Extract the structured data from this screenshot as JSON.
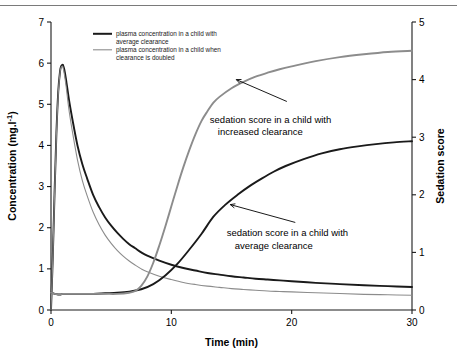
{
  "figure": {
    "top_rule": "horizontal-divider"
  },
  "chart_data": {
    "type": "line",
    "title": "",
    "xlabel": "Time (min)",
    "ylabel": "Concentration (mg.l-1)",
    "ylabel_display": "Concentration (mg.l",
    "ylabel_sup": "-1",
    "ylabel_tail": ")",
    "y2label": "Sedation score",
    "xlim": [
      0,
      30
    ],
    "ylim": [
      0,
      7
    ],
    "y2lim": [
      0,
      5
    ],
    "xticks": [
      0,
      10,
      20,
      30
    ],
    "yticks": [
      0,
      1,
      2,
      3,
      4,
      5,
      6,
      7
    ],
    "y2ticks": [
      0,
      1,
      2,
      3,
      4,
      5
    ],
    "grid": false,
    "legend_position": "top-left-inside",
    "colors": {
      "black": "#1a1a1a",
      "gray": "#8c8c8c"
    },
    "legend": [
      {
        "label": "plasma concentration in a child with average clearance",
        "line1": "plasma concentration in a child with",
        "line2": "average clearance",
        "color": "#1a1a1a",
        "width": 2.0
      },
      {
        "label": "plasma concentration in a child when clearance is doubled",
        "line1": "plasma concentration in a child when",
        "line2": "clearance is doubled",
        "color": "#8c8c8c",
        "width": 1.1
      }
    ],
    "annotations": [
      {
        "line1": "sedation score in a child with",
        "line2": "increased clearance",
        "text_x": 13.2,
        "text_y_axis2": 3.25,
        "arrow_from_x": 19.6,
        "arrow_from_y2": 3.62,
        "arrow_to_x": 15.4,
        "arrow_to_y2": 4.0
      },
      {
        "line1": "sedation score in a child with",
        "line2": "average clearance",
        "text_x": 14.6,
        "text_y_axis2": 1.28,
        "arrow_from_x": 20.3,
        "arrow_from_y2": 1.52,
        "arrow_to_x": 14.9,
        "arrow_to_y2": 1.83
      }
    ],
    "series": [
      {
        "name": "plasma concentration in a child with average clearance",
        "axis": "left",
        "color": "#1a1a1a",
        "width": 1.9,
        "x": [
          0,
          0.15,
          0.3,
          0.45,
          0.6,
          0.75,
          0.85,
          0.95,
          1.0,
          1.1,
          1.25,
          1.5,
          1.8,
          2.2,
          2.6,
          3.0,
          3.5,
          4.0,
          4.5,
          5.0,
          5.5,
          6.0,
          6.5,
          7.0,
          7.5,
          8.0,
          9.0,
          10.0,
          11.0,
          12.0,
          13.0,
          14.0,
          15.0,
          16.0,
          17.0,
          18.0,
          19.0,
          20.0,
          22.0,
          24.0,
          26.0,
          28.0,
          30.0
        ],
        "y": [
          0.0,
          1.3,
          2.9,
          4.3,
          5.3,
          5.8,
          5.93,
          5.96,
          5.95,
          5.85,
          5.6,
          5.1,
          4.6,
          4.0,
          3.55,
          3.2,
          2.8,
          2.5,
          2.25,
          2.05,
          1.88,
          1.73,
          1.6,
          1.5,
          1.4,
          1.32,
          1.2,
          1.1,
          1.02,
          0.96,
          0.9,
          0.86,
          0.82,
          0.79,
          0.76,
          0.74,
          0.72,
          0.7,
          0.66,
          0.63,
          0.6,
          0.58,
          0.56
        ]
      },
      {
        "name": "plasma concentration in a child when clearance is doubled",
        "axis": "left",
        "color": "#8c8c8c",
        "width": 1.1,
        "x": [
          0,
          0.15,
          0.3,
          0.45,
          0.6,
          0.75,
          0.85,
          0.95,
          1.0,
          1.1,
          1.25,
          1.5,
          1.8,
          2.2,
          2.6,
          3.0,
          3.5,
          4.0,
          4.5,
          5.0,
          5.5,
          6.0,
          6.5,
          7.0,
          7.5,
          8.0,
          9.0,
          10.0,
          11.0,
          12.0,
          13.0,
          14.0,
          15.0,
          16.0,
          17.0,
          18.0,
          19.0,
          20.0,
          22.0,
          24.0,
          26.0,
          28.0,
          30.0
        ],
        "y": [
          0.0,
          1.25,
          2.85,
          4.25,
          5.25,
          5.78,
          5.9,
          5.93,
          5.9,
          5.75,
          5.45,
          4.85,
          4.3,
          3.65,
          3.15,
          2.78,
          2.38,
          2.07,
          1.82,
          1.62,
          1.45,
          1.31,
          1.19,
          1.09,
          1.0,
          0.93,
          0.82,
          0.74,
          0.67,
          0.62,
          0.58,
          0.55,
          0.52,
          0.5,
          0.48,
          0.46,
          0.45,
          0.44,
          0.42,
          0.4,
          0.38,
          0.37,
          0.36
        ]
      },
      {
        "name": "sedation score in a child with average clearance",
        "axis": "right",
        "color": "#1a1a1a",
        "width": 1.9,
        "x": [
          0,
          0.3,
          0.6,
          0.8,
          1.0,
          1.3,
          1.8,
          2.5,
          3.5,
          4.5,
          5.5,
          6.5,
          7.5,
          8.5,
          9.5,
          10.5,
          11.5,
          12.5,
          13.5,
          14.5,
          15.5,
          16.5,
          17.5,
          18.5,
          19.5,
          21.0,
          22.5,
          24.0,
          25.5,
          27.0,
          28.5,
          30.0
        ],
        "y": [
          0.3,
          0.28,
          0.27,
          0.27,
          0.28,
          0.28,
          0.28,
          0.28,
          0.28,
          0.29,
          0.3,
          0.32,
          0.36,
          0.45,
          0.6,
          0.8,
          1.05,
          1.32,
          1.62,
          1.83,
          2.0,
          2.15,
          2.28,
          2.4,
          2.5,
          2.62,
          2.72,
          2.79,
          2.84,
          2.88,
          2.91,
          2.93
        ]
      },
      {
        "name": "sedation score in a child with increased clearance",
        "axis": "right",
        "color": "#8c8c8c",
        "width": 1.9,
        "x": [
          0,
          0.3,
          0.6,
          0.8,
          1.0,
          1.3,
          1.8,
          2.5,
          3.5,
          4.5,
          5.5,
          6.5,
          7.0,
          7.5,
          8.0,
          8.5,
          9.0,
          9.5,
          10.0,
          10.5,
          11.0,
          11.5,
          12.0,
          12.5,
          13.0,
          13.5,
          14.0,
          15.0,
          16.0,
          17.0,
          18.0,
          19.0,
          20.0,
          22.0,
          24.0,
          26.0,
          28.0,
          30.0
        ],
        "y": [
          0.3,
          0.28,
          0.27,
          0.27,
          0.28,
          0.28,
          0.28,
          0.28,
          0.28,
          0.28,
          0.28,
          0.3,
          0.33,
          0.42,
          0.58,
          0.82,
          1.12,
          1.45,
          1.8,
          2.15,
          2.48,
          2.78,
          3.05,
          3.28,
          3.45,
          3.6,
          3.7,
          3.85,
          3.96,
          4.05,
          4.12,
          4.18,
          4.23,
          4.32,
          4.39,
          4.44,
          4.48,
          4.5
        ]
      }
    ]
  }
}
